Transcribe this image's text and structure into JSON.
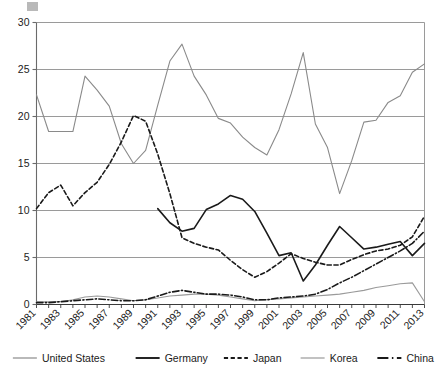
{
  "chart_data": {
    "type": "line",
    "title": "",
    "subtitle": "",
    "xlabel": "",
    "ylabel": "",
    "xlim": [
      1981,
      2013
    ],
    "ylim": [
      0,
      30
    ],
    "yticks": [
      0,
      5,
      10,
      15,
      20,
      25,
      30
    ],
    "ytick_labels": [
      "0",
      "5",
      "10",
      "15",
      "20",
      "25",
      "30"
    ],
    "grid": "horizontal",
    "legend_position": "bottom",
    "x": [
      1981,
      1982,
      1983,
      1984,
      1985,
      1986,
      1987,
      1988,
      1989,
      1990,
      1991,
      1992,
      1993,
      1994,
      1995,
      1996,
      1997,
      1998,
      1999,
      2000,
      2001,
      2002,
      2003,
      2004,
      2005,
      2006,
      2007,
      2008,
      2009,
      2010,
      2011,
      2012,
      2013
    ],
    "xtick_values": [
      1981,
      1983,
      1985,
      1987,
      1989,
      1991,
      1993,
      1995,
      1997,
      1999,
      2001,
      2003,
      2005,
      2007,
      2009,
      2011,
      2013
    ],
    "xtick_labels": [
      "1981",
      "1983",
      "1985",
      "1987",
      "1989",
      "1991",
      "1993",
      "1995",
      "1997",
      "1999",
      "2001",
      "2003",
      "2005",
      "2007",
      "2009",
      "2011",
      "2013"
    ],
    "series": [
      {
        "name": "United States",
        "color": "#8a8a8a",
        "style": "solid",
        "width": 1.1,
        "values": [
          22.3,
          18.4,
          18.4,
          18.4,
          24.3,
          22.8,
          21.1,
          17.1,
          15.0,
          16.4,
          21.2,
          25.9,
          27.7,
          24.3,
          22.3,
          19.8,
          19.3,
          17.8,
          16.7,
          15.9,
          18.6,
          22.4,
          26.8,
          19.2,
          16.7,
          11.8,
          15.3,
          19.4,
          19.6,
          21.5,
          22.2,
          24.7,
          25.6
        ]
      },
      {
        "name": "Germany",
        "color": "#1a1a1a",
        "style": "solid",
        "width": 1.6,
        "values": [
          null,
          null,
          null,
          null,
          null,
          null,
          null,
          null,
          null,
          null,
          10.2,
          8.7,
          7.8,
          8.1,
          10.1,
          10.7,
          11.6,
          11.2,
          9.9,
          7.6,
          5.2,
          5.5,
          2.5,
          4.2,
          6.3,
          8.3,
          7.1,
          5.9,
          6.1,
          6.4,
          6.7,
          5.2,
          6.5
        ]
      },
      {
        "name": "Japan",
        "color": "#1a1a1a",
        "style": "dashed",
        "width": 1.6,
        "values": [
          10.2,
          11.9,
          12.7,
          10.5,
          11.9,
          13.0,
          14.9,
          17.3,
          20.1,
          19.5,
          16.0,
          11.8,
          7.1,
          6.5,
          6.1,
          5.8,
          4.7,
          3.7,
          2.9,
          3.5,
          4.4,
          5.4,
          4.9,
          4.5,
          4.2,
          4.2,
          4.8,
          5.3,
          5.7,
          5.9,
          6.3,
          7.2,
          9.4
        ]
      },
      {
        "name": "Korea",
        "color": "#9a9a9a",
        "style": "solid",
        "width": 1.1,
        "values": [
          0.3,
          0.3,
          0.3,
          0.5,
          0.8,
          0.9,
          0.8,
          0.6,
          0.4,
          0.5,
          0.7,
          0.9,
          1.0,
          1.1,
          1.1,
          1.0,
          0.8,
          0.6,
          0.4,
          0.5,
          0.6,
          0.7,
          0.8,
          0.9,
          1.0,
          1.1,
          1.3,
          1.5,
          1.8,
          2.0,
          2.2,
          2.3,
          0.3
        ]
      },
      {
        "name": "China",
        "color": "#1a1a1a",
        "style": "dashdot",
        "width": 1.6,
        "values": [
          0.2,
          0.2,
          0.3,
          0.4,
          0.5,
          0.6,
          0.5,
          0.4,
          0.4,
          0.5,
          0.9,
          1.3,
          1.5,
          1.3,
          1.1,
          1.1,
          1.0,
          0.8,
          0.5,
          0.5,
          0.7,
          0.8,
          0.9,
          1.1,
          1.6,
          2.3,
          2.9,
          3.6,
          4.3,
          5.0,
          5.7,
          6.5,
          7.8
        ]
      }
    ],
    "legend": [
      {
        "label": "United States",
        "color": "#8a8a8a",
        "style": "solid"
      },
      {
        "label": "Germany",
        "color": "#1a1a1a",
        "style": "solid"
      },
      {
        "label": "Japan",
        "color": "#1a1a1a",
        "style": "dashed"
      },
      {
        "label": "Korea",
        "color": "#9a9a9a",
        "style": "solid"
      },
      {
        "label": "China",
        "color": "#1a1a1a",
        "style": "dashdot"
      }
    ]
  },
  "decor": {
    "corner_marker_color": "#b9b9b9"
  }
}
